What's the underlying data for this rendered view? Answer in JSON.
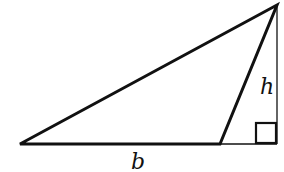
{
  "diagram": {
    "labels": {
      "base": "b",
      "height": "h"
    },
    "colors": {
      "stroke": "#111111",
      "background": "#ffffff"
    },
    "elements": [
      {
        "type": "triangle",
        "vertices": [
          [
            20,
            144
          ],
          [
            220,
            144
          ],
          [
            277,
            5
          ]
        ]
      },
      {
        "type": "altitude",
        "from": [
          277,
          5
        ],
        "to": [
          277,
          144
        ],
        "style": "thin"
      },
      {
        "type": "base-extension",
        "from": [
          220,
          144
        ],
        "to": [
          277,
          144
        ],
        "style": "thin"
      },
      {
        "type": "right-angle-marker",
        "at": [
          277,
          144
        ],
        "size": 20
      }
    ]
  }
}
